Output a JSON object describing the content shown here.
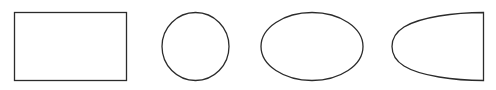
{
  "diagram": {
    "stroke_color": "#2b2b2b",
    "background": "#ffffff",
    "shapes": [
      {
        "type": "rectangle",
        "label": "rectangle"
      },
      {
        "type": "circle",
        "label": "circle"
      },
      {
        "type": "ellipse",
        "label": "ellipse"
      },
      {
        "type": "half-ellipse",
        "label": "half-ellipse"
      }
    ]
  }
}
